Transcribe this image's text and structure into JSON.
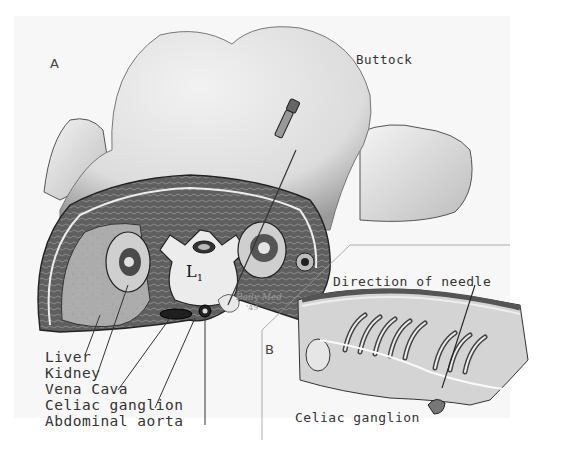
{
  "figure": {
    "panel_a": {
      "letter": "A",
      "region_label": "Buttock",
      "vertebra_label": "L",
      "vertebra_subscript": "1",
      "signature": "Baily Med",
      "signature_year": "'49",
      "legend": [
        {
          "id": "liver",
          "label": "Liver"
        },
        {
          "id": "kidney",
          "label": "Kidney"
        },
        {
          "id": "vena-cava",
          "label": "Vena Cava"
        },
        {
          "id": "celiac-ganglion",
          "label": "Celiac ganglion"
        },
        {
          "id": "abdominal-aorta",
          "label": "Abdominal aorta"
        }
      ]
    },
    "panel_b": {
      "letter": "B",
      "direction_label": "Direction of needle",
      "ganglion_label": "Celiac ganglion",
      "vertebra_marks": [
        "L",
        "1"
      ]
    }
  },
  "colors": {
    "background": "#ffffff",
    "plate": "#f7f7f7",
    "skin": "#e6e6e6",
    "ink": "#333333",
    "muscle": "#6a6a6a",
    "liver": "#a9a9a9"
  }
}
